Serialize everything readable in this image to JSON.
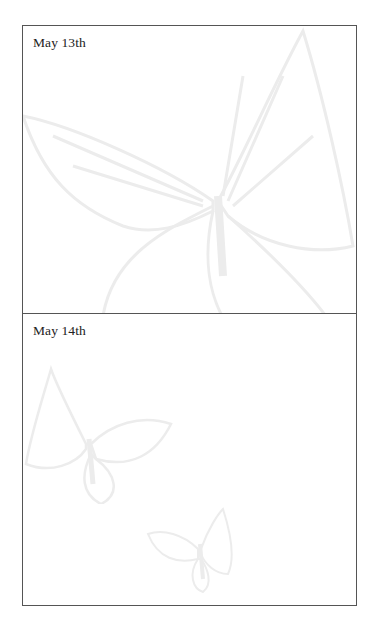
{
  "entries": [
    {
      "label": "May 13th"
    },
    {
      "label": "May 14th"
    }
  ],
  "watermark": {
    "icon": "butterfly-icon",
    "color": "#ececec"
  }
}
